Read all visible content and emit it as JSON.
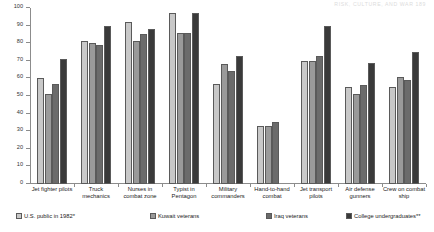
{
  "running_header": "RISK, CULTURE, AND WAR   189",
  "chart_data": {
    "type": "bar",
    "title": "",
    "subtitle": "",
    "xlabel": "",
    "ylabel": "",
    "ylim": [
      0,
      100
    ],
    "ytick_step": 10,
    "yticks": [
      0,
      10,
      20,
      30,
      40,
      50,
      60,
      70,
      80,
      90,
      100
    ],
    "ytick_labels": [
      "0",
      "10",
      "20",
      "30",
      "40",
      "50",
      "60",
      "70",
      "80",
      "90",
      "100"
    ],
    "grid": false,
    "legend_position": "bottom",
    "categories": [
      "Jet fighter pilots",
      "Truck mechanics",
      "Nurses in combat zone",
      "Typist in Pentagon",
      "Military commanders",
      "Hand-to-hand combat",
      "Jet transport pilots",
      "Air defense gunners",
      "Crew on combat ship"
    ],
    "category_lines": [
      [
        "Jet fighter pilots"
      ],
      [
        "Truck",
        "mechanics"
      ],
      [
        "Nurses in",
        "combat zone"
      ],
      [
        "Typist in",
        "Pentagon"
      ],
      [
        "Military",
        "commanders"
      ],
      [
        "Hand-to-hand",
        "combat"
      ],
      [
        "Jet transport",
        "pilots"
      ],
      [
        "Air defense",
        "gunners"
      ],
      [
        "Crew on combat",
        "ship"
      ]
    ],
    "series": [
      {
        "name": "U.S. public in 1982*",
        "color": "#c8c8c8",
        "values": [
          60,
          81,
          92,
          97,
          57,
          33,
          70,
          55,
          55
        ]
      },
      {
        "name": "Kuwait veterans",
        "color": "#9a9a9a",
        "values": [
          51,
          80,
          81,
          86,
          68,
          33,
          70,
          51,
          61
        ]
      },
      {
        "name": "Iraq veterans",
        "color": "#6b6b6b",
        "values": [
          57,
          79,
          85,
          86,
          64,
          35,
          73,
          56,
          59
        ]
      },
      {
        "name": "College undergraduates**",
        "color": "#3a3a3a",
        "values": [
          71,
          90,
          88,
          97,
          73,
          null,
          90,
          69,
          75
        ]
      }
    ]
  },
  "legend": {
    "items": [
      {
        "label": "U.S. public in 1982*",
        "color": "#c8c8c8"
      },
      {
        "label": "Kuwait veterans",
        "color": "#9a9a9a"
      },
      {
        "label": "Iraq veterans",
        "color": "#6b6b6b"
      },
      {
        "label": "College undergraduates**",
        "color": "#3a3a3a"
      }
    ]
  }
}
